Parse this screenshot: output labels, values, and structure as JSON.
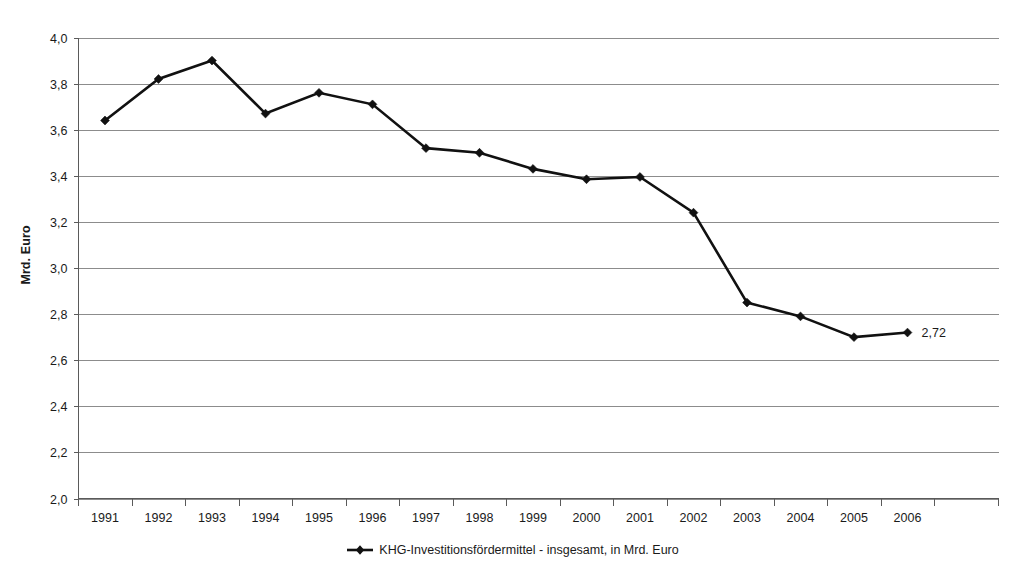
{
  "chart_data": {
    "type": "line",
    "title": "",
    "xlabel": "",
    "ylabel": "Mrd. Euro",
    "ylim": [
      2.0,
      4.0
    ],
    "ytick_step": 0.2,
    "grid": true,
    "legend_position": "bottom-center",
    "categories": [
      "1991",
      "1992",
      "1993",
      "1994",
      "1995",
      "1996",
      "1997",
      "1998",
      "1999",
      "2000",
      "2001",
      "2002",
      "2003",
      "2004",
      "2005",
      "2006"
    ],
    "ytick_labels": [
      "2,0",
      "2,2",
      "2,4",
      "2,6",
      "2,8",
      "3,0",
      "3,2",
      "3,4",
      "3,6",
      "3,8",
      "4,0"
    ],
    "ytick_values": [
      2.0,
      2.2,
      2.4,
      2.6,
      2.8,
      3.0,
      3.2,
      3.4,
      3.6,
      3.8,
      4.0
    ],
    "series": [
      {
        "name": "KHG-Investitionsfördermittel - insgesamt, in Mrd. Euro",
        "color": "#111111",
        "marker": "diamond",
        "values": [
          3.64,
          3.82,
          3.9,
          3.67,
          3.76,
          3.71,
          3.52,
          3.5,
          3.43,
          3.385,
          3.395,
          3.24,
          2.85,
          2.79,
          2.7,
          2.72
        ]
      }
    ],
    "annotations": [
      {
        "text": "2,72",
        "category": "2006",
        "value": 2.72
      }
    ]
  },
  "legend": {
    "label": "KHG-Investitionsfördermittel - insgesamt, in Mrd. Euro",
    "marker_icon": "diamond-marker-icon"
  },
  "axes": {
    "y_title": "Mrd. Euro"
  }
}
